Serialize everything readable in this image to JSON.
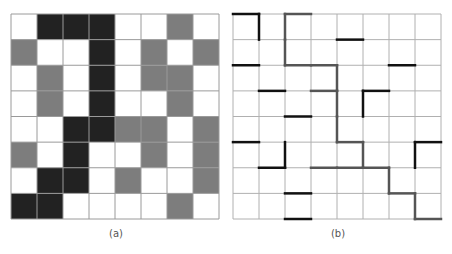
{
  "panels": [
    {
      "id": "a",
      "label": "(a)",
      "rows": 8,
      "cols": 8,
      "legend": {
        "W": "white",
        "G": "gray",
        "B": "black"
      },
      "colors": {
        "W": "#ffffff",
        "G": "#7d7d7d",
        "B": "#222222",
        "grid": "#9a9a9a"
      },
      "cells": [
        [
          "W",
          "B",
          "B",
          "B",
          "W",
          "W",
          "G",
          "W"
        ],
        [
          "G",
          "W",
          "W",
          "B",
          "W",
          "G",
          "W",
          "G"
        ],
        [
          "W",
          "G",
          "W",
          "B",
          "W",
          "G",
          "G",
          "W"
        ],
        [
          "W",
          "G",
          "W",
          "B",
          "W",
          "W",
          "G",
          "W"
        ],
        [
          "W",
          "W",
          "B",
          "B",
          "G",
          "G",
          "W",
          "G"
        ],
        [
          "G",
          "W",
          "B",
          "W",
          "W",
          "G",
          "W",
          "G"
        ],
        [
          "W",
          "B",
          "B",
          "W",
          "G",
          "W",
          "W",
          "G"
        ],
        [
          "B",
          "B",
          "W",
          "W",
          "W",
          "W",
          "G",
          "W"
        ]
      ]
    },
    {
      "id": "b",
      "label": "(b)",
      "rows": 8,
      "cols": 8,
      "colors": {
        "black": "#111111",
        "gray": "#555555",
        "grid": "#b0b0b0"
      },
      "edges_note": "h = horizontal edge on grid-line row r spanning column c; v = vertical edge on grid-line column c spanning row r",
      "edges": [
        {
          "type": "h",
          "r": 0,
          "c": 0,
          "tone": "black"
        },
        {
          "type": "v",
          "c": 1,
          "r": 0,
          "tone": "black"
        },
        {
          "type": "h",
          "r": 0,
          "c": 2,
          "tone": "gray"
        },
        {
          "type": "v",
          "c": 2,
          "r": 0,
          "tone": "gray"
        },
        {
          "type": "v",
          "c": 2,
          "r": 1,
          "tone": "gray"
        },
        {
          "type": "h",
          "r": 1,
          "c": 4,
          "tone": "black"
        },
        {
          "type": "h",
          "r": 2,
          "c": 0,
          "tone": "black"
        },
        {
          "type": "h",
          "r": 2,
          "c": 2,
          "tone": "gray"
        },
        {
          "type": "h",
          "r": 2,
          "c": 3,
          "tone": "gray"
        },
        {
          "type": "h",
          "r": 2,
          "c": 6,
          "tone": "black"
        },
        {
          "type": "v",
          "c": 4,
          "r": 2,
          "tone": "gray"
        },
        {
          "type": "v",
          "c": 4,
          "r": 3,
          "tone": "gray"
        },
        {
          "type": "v",
          "c": 4,
          "r": 4,
          "tone": "gray"
        },
        {
          "type": "h",
          "r": 3,
          "c": 1,
          "tone": "black"
        },
        {
          "type": "h",
          "r": 3,
          "c": 3,
          "tone": "gray"
        },
        {
          "type": "h",
          "r": 3,
          "c": 5,
          "tone": "black"
        },
        {
          "type": "v",
          "c": 5,
          "r": 3,
          "tone": "black"
        },
        {
          "type": "h",
          "r": 4,
          "c": 2,
          "tone": "black"
        },
        {
          "type": "h",
          "r": 5,
          "c": 0,
          "tone": "black"
        },
        {
          "type": "v",
          "c": 2,
          "r": 5,
          "tone": "black"
        },
        {
          "type": "h",
          "r": 5,
          "c": 4,
          "tone": "gray"
        },
        {
          "type": "v",
          "c": 5,
          "r": 5,
          "tone": "gray"
        },
        {
          "type": "h",
          "r": 5,
          "c": 7,
          "tone": "black"
        },
        {
          "type": "v",
          "c": 7,
          "r": 5,
          "tone": "black"
        },
        {
          "type": "h",
          "r": 6,
          "c": 1,
          "tone": "black"
        },
        {
          "type": "h",
          "r": 6,
          "c": 3,
          "tone": "gray"
        },
        {
          "type": "h",
          "r": 6,
          "c": 4,
          "tone": "gray"
        },
        {
          "type": "h",
          "r": 6,
          "c": 5,
          "tone": "gray"
        },
        {
          "type": "v",
          "c": 6,
          "r": 6,
          "tone": "gray"
        },
        {
          "type": "h",
          "r": 7,
          "c": 2,
          "tone": "black"
        },
        {
          "type": "h",
          "r": 7,
          "c": 6,
          "tone": "gray"
        },
        {
          "type": "v",
          "c": 7,
          "r": 7,
          "tone": "gray"
        },
        {
          "type": "h",
          "r": 8,
          "c": 2,
          "tone": "black"
        },
        {
          "type": "h",
          "r": 8,
          "c": 7,
          "tone": "gray"
        }
      ]
    }
  ]
}
